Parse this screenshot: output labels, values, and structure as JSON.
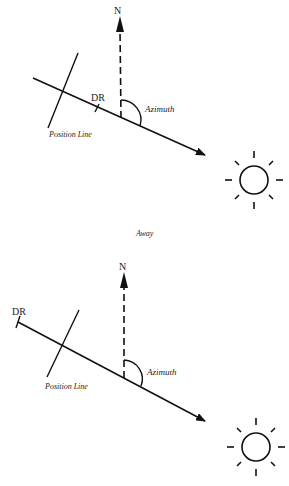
{
  "diagrams": [
    {
      "north_label": "N",
      "dr_label": "DR",
      "azimuth_label": "Azimuth",
      "position_line_label": "Position Line"
    },
    {
      "north_label": "N",
      "dr_label": "DR",
      "azimuth_label": "Azimuth",
      "position_line_label": "Position Line"
    }
  ],
  "caption": "Away",
  "colors": {
    "ink": "#111111",
    "background": "#ffffff"
  }
}
